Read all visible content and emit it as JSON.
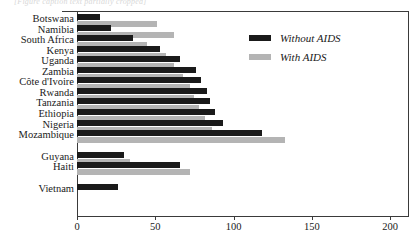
{
  "top_remnant_text": "[Figure caption text partially cropped]",
  "legend": {
    "position": "top-right",
    "entries": [
      {
        "label": "Without AIDS",
        "color": "#1a1a1a",
        "key": "without"
      },
      {
        "label": "With AIDS",
        "color": "#b4b4b4",
        "key": "with"
      }
    ]
  },
  "axis": {
    "x_ticks": [
      "0",
      "50",
      "100",
      "150",
      "200"
    ],
    "x_tick_values": [
      0,
      50,
      100,
      150,
      200
    ]
  },
  "chart_data": {
    "type": "bar",
    "orientation": "horizontal",
    "title": "",
    "subtitle": "",
    "xlabel": "",
    "ylabel": "",
    "xlim": [
      0,
      200
    ],
    "grid": false,
    "legend_position": "top-right",
    "categories": [
      "Botswana",
      "Namibia",
      "South Africa",
      "Kenya",
      "Uganda",
      "Zambia",
      "Côte d'Ivoire",
      "Rwanda",
      "Tanzania",
      "Ethiopia",
      "Nigeria",
      "Mozambique",
      "Guyana",
      "Haiti",
      "Vietnam"
    ],
    "group_breaks_after": [
      "Mozambique",
      "Haiti"
    ],
    "series": [
      {
        "name": "Without AIDS",
        "color": "#1a1a1a",
        "values": [
          15,
          22,
          36,
          53,
          66,
          76,
          79,
          83,
          85,
          88,
          93,
          118,
          30,
          66,
          26
        ]
      },
      {
        "name": "With AIDS",
        "color": "#b4b4b4",
        "values": [
          51,
          62,
          45,
          57,
          62,
          68,
          72,
          75,
          78,
          82,
          86,
          133,
          34,
          72,
          0
        ]
      }
    ]
  }
}
